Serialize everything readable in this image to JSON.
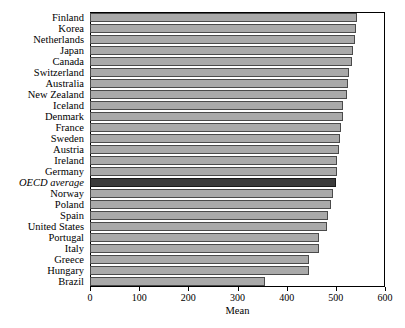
{
  "chart_data": {
    "type": "bar",
    "orientation": "horizontal",
    "title": "",
    "xlabel": "Mean",
    "ylabel": "",
    "xlim": [
      0,
      600
    ],
    "xticks": [
      0,
      100,
      200,
      300,
      400,
      500,
      600
    ],
    "xtick_labels": [
      "0",
      "100",
      "200",
      "300",
      "400",
      "500",
      "600"
    ],
    "grid": false,
    "legend": "none",
    "highlight_category": "OECD average",
    "colors": {
      "bar": "#a9a9a9",
      "bar_edge": "#4a4a4a",
      "highlight_bar": "#3b3b3b",
      "highlight_edge": "#1a1a1a",
      "frame": "#000000",
      "text": "#000000",
      "background": "#ffffff"
    },
    "categories": [
      "Finland",
      "Korea",
      "Netherlands",
      "Japan",
      "Canada",
      "Switzerland",
      "Australia",
      "New Zealand",
      "Iceland",
      "Denmark",
      "France",
      "Sweden",
      "Austria",
      "Ireland",
      "Germany",
      "OECD average",
      "Norway",
      "Poland",
      "Spain",
      "United States",
      "Portugal",
      "Italy",
      "Greece",
      "Hungary",
      "Brazil"
    ],
    "values": [
      544,
      542,
      538,
      534,
      532,
      527,
      524,
      523,
      515,
      514,
      511,
      509,
      506,
      503,
      503,
      500,
      495,
      490,
      485,
      483,
      466,
      466,
      445,
      445,
      356
    ]
  }
}
